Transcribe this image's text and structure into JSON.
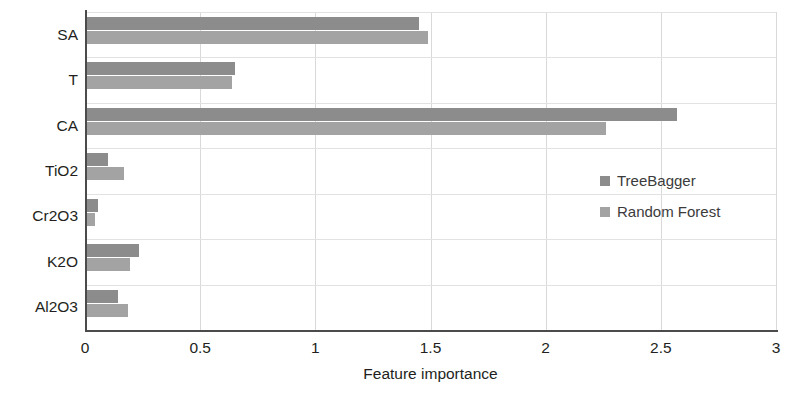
{
  "chart_data": {
    "type": "bar",
    "orientation": "horizontal",
    "title": "",
    "xlabel": "Feature importance",
    "ylabel": "",
    "xlim": [
      0,
      3
    ],
    "xticks": [
      "0",
      "0.5",
      "1",
      "1.5",
      "2",
      "2.5",
      "3"
    ],
    "xtick_values": [
      0,
      0.5,
      1,
      1.5,
      2,
      2.5,
      3
    ],
    "grid": true,
    "legend_position": "inside-right",
    "categories": [
      "SA",
      "T",
      "CA",
      "TiO2",
      "Cr2O3",
      "K2O",
      "Al2O3"
    ],
    "series": [
      {
        "name": "TreeBagger",
        "color": "#8c8c8c",
        "values": [
          1.45,
          0.65,
          2.57,
          0.1,
          0.055,
          0.235,
          0.145
        ]
      },
      {
        "name": "Random Forest",
        "color": "#a3a3a3",
        "values": [
          1.49,
          0.64,
          2.26,
          0.17,
          0.045,
          0.195,
          0.185
        ]
      }
    ]
  },
  "axes": {
    "x_axis_title": "Feature importance"
  },
  "legend": {
    "items": [
      {
        "label": "TreeBagger",
        "color": "#8c8c8c"
      },
      {
        "label": "Random Forest",
        "color": "#a3a3a3"
      }
    ]
  },
  "caption": {
    "text": ""
  }
}
